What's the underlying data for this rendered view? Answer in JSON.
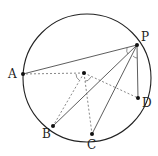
{
  "diagram": {
    "type": "circle-geometry",
    "circle": {
      "cx": 87,
      "cy": 78,
      "r": 64
    },
    "center": {
      "x": 84,
      "y": 73
    },
    "points": [
      {
        "id": "A",
        "label": "A",
        "x": 23,
        "y": 74,
        "lx": 8,
        "ly": 78
      },
      {
        "id": "P",
        "label": "P",
        "x": 137,
        "y": 45,
        "lx": 141,
        "ly": 41
      },
      {
        "id": "B",
        "label": "B",
        "x": 53,
        "y": 126,
        "lx": 42,
        "ly": 138
      },
      {
        "id": "C",
        "label": "C",
        "x": 92,
        "y": 134,
        "lx": 87,
        "ly": 149
      },
      {
        "id": "D",
        "label": "D",
        "x": 138,
        "y": 98,
        "lx": 142,
        "ly": 107
      }
    ],
    "solid_segments": [
      [
        "P",
        "A"
      ],
      [
        "P",
        "B"
      ],
      [
        "P",
        "C"
      ],
      [
        "P",
        "D"
      ]
    ],
    "dashed_segments": [
      [
        "O",
        "A"
      ],
      [
        "O",
        "B"
      ],
      [
        "O",
        "C"
      ],
      [
        "O",
        "D"
      ]
    ],
    "angle_marks": [
      "angle-APB at P",
      "angle-CPD at P",
      "angle-AOB at O",
      "angle-COD at O"
    ],
    "colors": {
      "stroke": "#222222",
      "dashed": "#555555"
    }
  }
}
